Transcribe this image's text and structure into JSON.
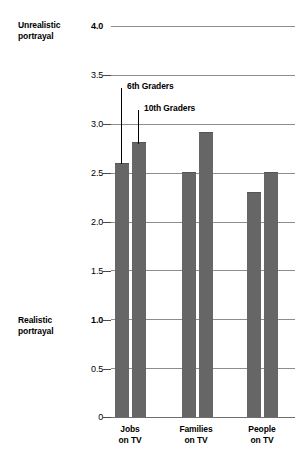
{
  "chart_data": {
    "type": "bar",
    "title": "",
    "xlabel": "",
    "ylabel": "",
    "categories": [
      "Jobs\non TV",
      "Families\non TV",
      "People\non TV"
    ],
    "series": [
      {
        "name": "6th Graders",
        "values": [
          2.6,
          2.51,
          2.3
        ]
      },
      {
        "name": "10th Graders",
        "values": [
          2.81,
          2.92,
          2.51
        ]
      }
    ],
    "ylim": [
      0,
      4.0
    ],
    "yticks": [
      "0",
      "0.5",
      "1.0",
      "1.5",
      "2.0",
      "2.5",
      "3.0",
      "3.5",
      "4.0"
    ],
    "ytick_values": [
      0,
      0.5,
      1.0,
      1.5,
      2.0,
      2.5,
      3.0,
      3.5,
      4.0
    ],
    "grid": true,
    "legend_position": "inside-top-left",
    "annotations": {
      "axis_top_label": "Unrealistic\nportrayal",
      "axis_bottom_label": "Realistic\nportrayal",
      "axis_top_label_value": 4.0,
      "axis_bottom_label_value": 1.0
    },
    "colors": {
      "bar": "#666666",
      "gridline": "#8d8d8d",
      "text": "#000000",
      "background": "#ffffff"
    }
  },
  "axis": {
    "tick_0": "0",
    "tick_05": "0.5",
    "tick_10": "1.0",
    "tick_15": "1.5",
    "tick_20": "2.0",
    "tick_25": "2.5",
    "tick_30": "3.0",
    "tick_35": "3.5",
    "tick_40": "4.0"
  },
  "labels": {
    "unrealistic": "Unrealistic\nportrayal",
    "realistic": "Realistic\nportrayal",
    "cat_jobs": "Jobs\non TV",
    "cat_families": "Families\non TV",
    "cat_people": "People\non TV"
  },
  "legend": {
    "series_a": "6th Graders",
    "series_b": "10th Graders"
  }
}
